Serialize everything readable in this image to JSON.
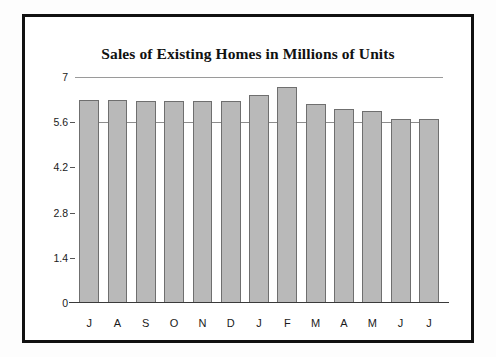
{
  "chart_data": {
    "type": "bar",
    "title": "Sales of Existing Homes in Millions of Units",
    "xlabel": "",
    "ylabel": "",
    "categories": [
      "J",
      "A",
      "S",
      "O",
      "N",
      "D",
      "J",
      "F",
      "M",
      "A",
      "M",
      "J",
      "J"
    ],
    "values": [
      6.3,
      6.3,
      6.25,
      6.25,
      6.25,
      6.25,
      6.45,
      6.7,
      6.15,
      6.0,
      5.95,
      5.7,
      5.7
    ],
    "ylim": [
      0,
      7
    ],
    "yticks": [
      0,
      1.4,
      2.8,
      4.2,
      5.6,
      7
    ],
    "ytick_labels": [
      "0",
      "1.4",
      "2.8",
      "4.2",
      "5.6",
      "7"
    ],
    "grid": "top-line-only",
    "legend": "none",
    "bar_color": "#b9b9b9",
    "bar_border_color": "#6f6f6f",
    "frame_color": "#111111",
    "background": "#ffffff"
  }
}
